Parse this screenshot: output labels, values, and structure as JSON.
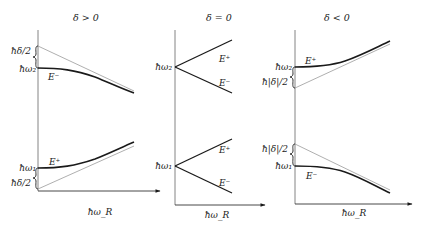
{
  "panels": [
    {
      "title": "δ > 0",
      "x_axis_label": "ħω_R",
      "top": {
        "level_label": "ħω₂",
        "gap_label": "ħδ/2",
        "curve_label": "E⁻",
        "branch": "E⁻ below, bends down, approaches asymptote (grey) from below"
      },
      "bottom": {
        "level_label": "ħω₁",
        "gap_label": "ħδ/2",
        "curve_label": "E⁺",
        "branch": "E⁺ above, bends up, approaches asymptote (grey) from above"
      }
    },
    {
      "title": "δ = 0",
      "x_axis_label": "ħω_R",
      "top": {
        "level_label": "ħω₂",
        "upper_label": "E⁺",
        "lower_label": "E⁻"
      },
      "bottom": {
        "level_label": "ħω₁",
        "upper_label": "E⁺",
        "lower_label": "E⁻"
      }
    },
    {
      "title": "δ < 0",
      "x_axis_label": "ħω_R",
      "top": {
        "level_label": "ħω₂",
        "gap_label": "ħ|δ|/2",
        "curve_label": "E⁺"
      },
      "bottom": {
        "level_label": "ħω₁",
        "gap_label": "ħ|δ|/2",
        "curve_label": "E⁻"
      }
    }
  ],
  "colors": {
    "curve": "#1a1a1a",
    "asymptote": "#9a9a9a",
    "axis": "#555555"
  }
}
